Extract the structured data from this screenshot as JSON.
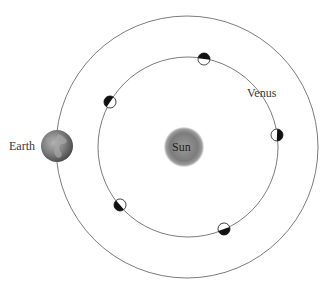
{
  "labels": {
    "earth": "Earth",
    "venus": "Venus",
    "sun": "Sun"
  },
  "orbits": {
    "earth": {
      "cx": 187,
      "cy": 147,
      "r": 131
    },
    "venus": {
      "cx": 188,
      "cy": 147,
      "r": 90
    }
  },
  "sun": {
    "cx": 184,
    "cy": 147,
    "r": 20,
    "color": "#7a7a7a"
  },
  "earth_body": {
    "cx": 57,
    "cy": 146,
    "r": 16
  },
  "venus_phases": [
    {
      "cx": 204,
      "cy": 59
    },
    {
      "cx": 110,
      "cy": 102
    },
    {
      "cx": 277,
      "cy": 135
    },
    {
      "cx": 120,
      "cy": 205
    },
    {
      "cx": 224,
      "cy": 229
    }
  ]
}
